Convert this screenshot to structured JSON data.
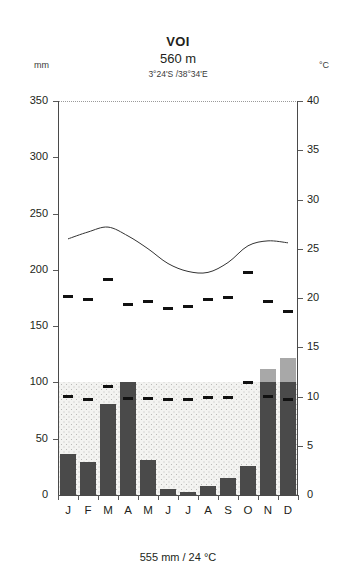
{
  "header": {
    "station": "VOI",
    "elevation": "560 m",
    "coordinates": "3°24'S /38°34'E",
    "left_unit": "mm",
    "right_unit": "°C"
  },
  "footer": {
    "caption": "555 mm / 24 °C"
  },
  "chart_data": {
    "type": "bar",
    "title": "VOI",
    "subtitle": "560 m",
    "annotation": "3°24'S /38°34'E",
    "footer_annotation": "555 mm / 24 °C",
    "xlabel": "",
    "ylabel": "mm",
    "y2label": "°C",
    "ylim": [
      0,
      350
    ],
    "y2lim": [
      0,
      40
    ],
    "grid": false,
    "legend": "none",
    "categories": [
      "J",
      "F",
      "M",
      "A",
      "M",
      "J",
      "J",
      "A",
      "S",
      "O",
      "N",
      "D"
    ],
    "y_ticks": [
      0,
      50,
      100,
      150,
      200,
      250,
      300,
      350
    ],
    "y_tick_labels": [
      "0",
      "50",
      "100",
      "150",
      "200",
      "250",
      "300",
      "350"
    ],
    "y2_ticks": [
      0,
      5,
      10,
      15,
      20,
      25,
      30,
      35,
      40
    ],
    "y2_tick_labels": [
      "0",
      "5",
      "10",
      "15",
      "20",
      "25",
      "30",
      "35",
      "40"
    ],
    "series": [
      {
        "name": "Precipitation (mm)",
        "unit": "mm",
        "values": [
          36,
          29,
          81,
          100,
          31,
          5,
          3,
          8,
          15,
          26,
          112,
          122
        ]
      },
      {
        "name": "Mean temperature (°C)",
        "unit": "°C",
        "values": [
          26.0,
          26.7,
          27.2,
          26.3,
          25.0,
          23.5,
          22.7,
          22.6,
          23.6,
          25.3,
          25.8,
          25.6
        ]
      },
      {
        "name": "Mean daily maximum (°C)",
        "unit": "°C",
        "values": [
          20.2,
          19.8,
          21.9,
          19.3,
          19.6,
          18.9,
          19.1,
          19.8,
          20.1,
          22.6,
          19.6,
          18.6
        ]
      },
      {
        "name": "Mean daily minimum (°C)",
        "unit": "°C",
        "values": [
          10.0,
          9.7,
          11.0,
          9.8,
          9.8,
          9.7,
          9.7,
          9.9,
          9.9,
          11.4,
          10.0,
          9.7
        ]
      }
    ],
    "annual_total_precipitation_mm": 555,
    "annual_mean_temperature_c": 24
  }
}
